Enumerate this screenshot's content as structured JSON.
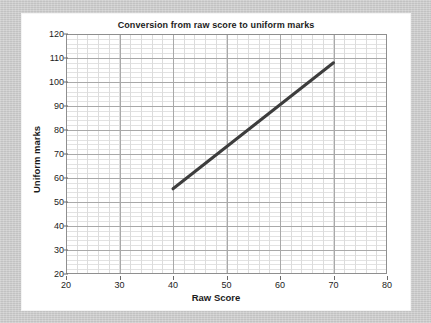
{
  "figure": {
    "background_color": "#c9c9c9",
    "panel_color": "#ffffff"
  },
  "chart_data": {
    "type": "line",
    "title": "Conversion from raw score to uniform marks",
    "xlabel": "Raw Score",
    "ylabel": "Uniform marks",
    "xlim": [
      20,
      80
    ],
    "ylim": [
      20,
      120
    ],
    "xticks": [
      20,
      30,
      40,
      50,
      60,
      70,
      80
    ],
    "yticks": [
      20,
      30,
      40,
      50,
      60,
      70,
      80,
      90,
      100,
      110,
      120
    ],
    "xtick_labels": [
      "20",
      "30",
      "40",
      "50",
      "60",
      "70",
      "80"
    ],
    "ytick_labels": [
      "20",
      "30",
      "40",
      "50",
      "60",
      "70",
      "80",
      "90",
      "100",
      "110",
      "120"
    ],
    "x_minor_step": 2,
    "y_minor_step": 2,
    "grid": true,
    "grid_major_color": "#a9a9a9",
    "grid_minor_color": "#dcdcdc",
    "legend": null,
    "series": [
      {
        "name": "Conversion line",
        "color": "#3d3d3d",
        "line_width": 3,
        "x": [
          40,
          70
        ],
        "y": [
          55.5,
          108
        ],
        "points": [
          {
            "x": 40,
            "y": 55.5
          },
          {
            "x": 70,
            "y": 108
          }
        ]
      }
    ],
    "annotations": []
  }
}
